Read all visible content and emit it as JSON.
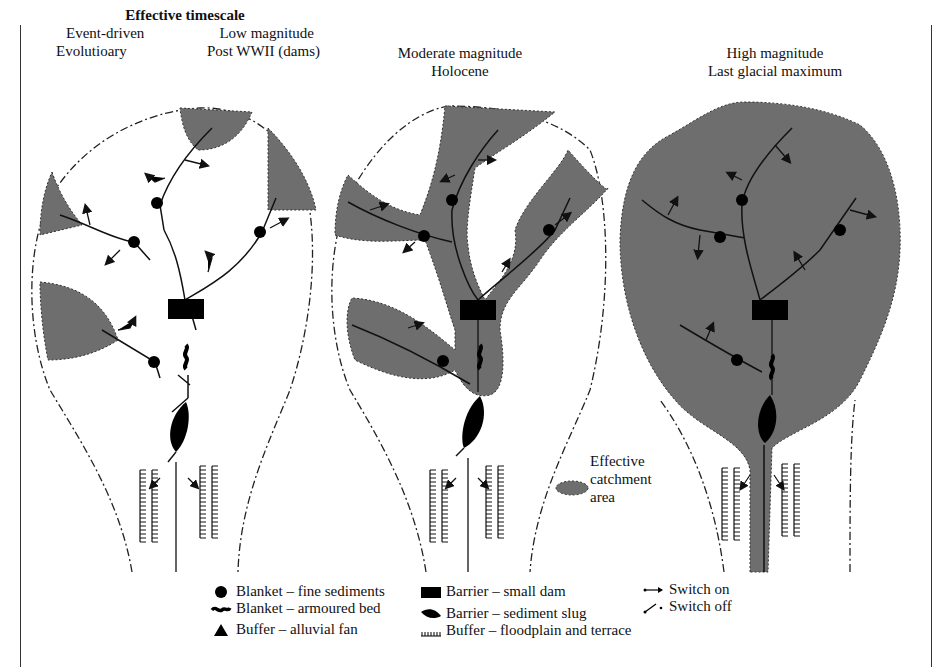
{
  "header": {
    "title": "Effective timescale",
    "panel1": {
      "left_line1": "Event-driven",
      "left_line2": "Evolutioary",
      "right_line1": "Low magnitude",
      "right_line2": "Post WWII (dams)"
    },
    "panel2": {
      "line1": "Moderate magnitude",
      "line2": "Holocene"
    },
    "panel3": {
      "line1": "High magnitude",
      "line2": "Last glacial maximum"
    }
  },
  "catchment_label": {
    "line1": "Effective",
    "line2": "catchment",
    "line3": "area"
  },
  "legend": {
    "col1": [
      {
        "icon": "filled-circle-icon",
        "label": "Blanket – fine sediments"
      },
      {
        "icon": "wavy-bed-icon",
        "label": "Blanket – armoured bed"
      },
      {
        "icon": "triangle-icon",
        "label": "Buffer – alluvial fan"
      }
    ],
    "col2": [
      {
        "icon": "rectangle-dam-icon",
        "label": "Barrier – small dam"
      },
      {
        "icon": "sediment-slug-icon",
        "label": "Barrier – sediment slug"
      },
      {
        "icon": "floodplain-hatch-icon",
        "label": "Buffer – floodplain and terrace"
      }
    ],
    "col3": [
      {
        "icon": "switch-on-arrow-icon",
        "label": "Switch on"
      },
      {
        "icon": "switch-off-arrow-icon",
        "label": "Switch off"
      }
    ]
  },
  "colors": {
    "catchment_fill": "#6e6e6e",
    "ink": "#111111",
    "background": "#ffffff"
  }
}
